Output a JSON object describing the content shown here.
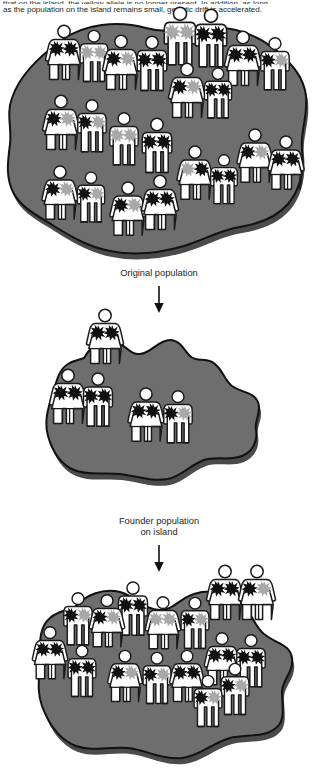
{
  "caption": {
    "line1": "that on the island, the yellow allele is no longer present. In addition, as long",
    "line2": "as the population on the island remains small, genetic drift is accelerated."
  },
  "labels": {
    "original": "Original population",
    "founder_line1": "Founder population",
    "founder_line2": "on island"
  },
  "legend_semantics": {
    "island_fill": "#6e6e6e",
    "island_shadow": "#2b2b2b",
    "island_outline": "#111111",
    "figure_fill": "#ffffff",
    "figure_outline": "#1a1a1a",
    "allele_dark": "#111111",
    "allele_light": "#a8a8a8",
    "background": "#ffffff",
    "text": "#231f20",
    "arrow": "#111111"
  },
  "panels": [
    {
      "id": "original-population",
      "name": "Original population",
      "island_shape": "large irregular blob spanning full width",
      "population_count": 24,
      "people": [
        {
          "id": 1,
          "sex": "female",
          "x": 64,
          "y": 42,
          "s": 1.0,
          "alleles": [
            "dark",
            "dark"
          ]
        },
        {
          "id": 2,
          "sex": "male",
          "x": 94,
          "y": 45,
          "s": 0.94,
          "alleles": [
            "light",
            "light"
          ]
        },
        {
          "id": 3,
          "sex": "female",
          "x": 121,
          "y": 52,
          "s": 1.0,
          "alleles": [
            "dark",
            "light"
          ]
        },
        {
          "id": 4,
          "sex": "male",
          "x": 152,
          "y": 53,
          "s": 1.0,
          "alleles": [
            "dark",
            "dark"
          ]
        },
        {
          "id": 5,
          "sex": "male",
          "x": 180,
          "y": 26,
          "s": 1.06,
          "alleles": [
            "light",
            "light"
          ]
        },
        {
          "id": 6,
          "sex": "male",
          "x": 211,
          "y": 28,
          "s": 1.06,
          "alleles": [
            "dark",
            "dark"
          ]
        },
        {
          "id": 7,
          "sex": "female",
          "x": 243,
          "y": 48,
          "s": 1.0,
          "alleles": [
            "dark",
            "dark"
          ]
        },
        {
          "id": 8,
          "sex": "male",
          "x": 275,
          "y": 53,
          "s": 0.96,
          "alleles": [
            "dark",
            "light"
          ]
        },
        {
          "id": 9,
          "sex": "female",
          "x": 187,
          "y": 80,
          "s": 1.0,
          "alleles": [
            "dark",
            "light"
          ]
        },
        {
          "id": 10,
          "sex": "male",
          "x": 218,
          "y": 82,
          "s": 0.92,
          "alleles": [
            "dark",
            "dark"
          ]
        },
        {
          "id": 11,
          "sex": "female",
          "x": 61,
          "y": 112,
          "s": 1.0,
          "alleles": [
            "dark",
            "light"
          ]
        },
        {
          "id": 12,
          "sex": "male",
          "x": 92,
          "y": 115,
          "s": 0.96,
          "alleles": [
            "dark",
            "light"
          ]
        },
        {
          "id": 13,
          "sex": "male",
          "x": 124,
          "y": 128,
          "s": 0.96,
          "alleles": [
            "light",
            "light"
          ]
        },
        {
          "id": 14,
          "sex": "male",
          "x": 157,
          "y": 135,
          "s": 1.0,
          "alleles": [
            "dark",
            "dark"
          ]
        },
        {
          "id": 15,
          "sex": "female",
          "x": 255,
          "y": 145,
          "s": 0.98,
          "alleles": [
            "dark",
            "light"
          ]
        },
        {
          "id": 16,
          "sex": "female",
          "x": 286,
          "y": 152,
          "s": 0.98,
          "alleles": [
            "dark",
            "dark"
          ]
        },
        {
          "id": 17,
          "sex": "female",
          "x": 195,
          "y": 162,
          "s": 0.98,
          "alleles": [
            "light",
            "dark"
          ]
        },
        {
          "id": 18,
          "sex": "male",
          "x": 224,
          "y": 168,
          "s": 0.9,
          "alleles": [
            "dark",
            "dark"
          ]
        },
        {
          "id": 19,
          "sex": "female",
          "x": 60,
          "y": 182,
          "s": 0.98,
          "alleles": [
            "dark",
            "light"
          ]
        },
        {
          "id": 20,
          "sex": "male",
          "x": 91,
          "y": 186,
          "s": 0.92,
          "alleles": [
            "dark",
            "light"
          ]
        },
        {
          "id": 21,
          "sex": "female",
          "x": 128,
          "y": 198,
          "s": 0.98,
          "alleles": [
            "dark",
            "light"
          ]
        },
        {
          "id": 22,
          "sex": "female",
          "x": 160,
          "y": 192,
          "s": 1.0,
          "alleles": [
            "dark",
            "dark"
          ]
        }
      ]
    },
    {
      "id": "founder-population",
      "name": "Founder population on island",
      "island_shape": "smaller lobed blob, centre of frame",
      "population_count": 5,
      "people": [
        {
          "id": 1,
          "sex": "female",
          "x": 105,
          "y": 22,
          "s": 1.0,
          "alleles": [
            "dark",
            "dark"
          ]
        },
        {
          "id": 2,
          "sex": "female",
          "x": 68,
          "y": 82,
          "s": 1.0,
          "alleles": [
            "dark",
            "dark"
          ]
        },
        {
          "id": 3,
          "sex": "male",
          "x": 98,
          "y": 85,
          "s": 0.98,
          "alleles": [
            "dark",
            "dark"
          ]
        },
        {
          "id": 4,
          "sex": "female",
          "x": 146,
          "y": 100,
          "s": 0.98,
          "alleles": [
            "dark",
            "dark"
          ]
        },
        {
          "id": 5,
          "sex": "male",
          "x": 178,
          "y": 102,
          "s": 0.96,
          "alleles": [
            "dark",
            "light"
          ]
        }
      ]
    },
    {
      "id": "expanded-island-population",
      "name": "Expanded island population",
      "island_shape": "wide lobed blob spanning most of frame",
      "population_count": 20,
      "people": [
        {
          "id": 1,
          "sex": "female",
          "x": 225,
          "y": 22,
          "s": 1.0,
          "alleles": [
            "dark",
            "dark"
          ]
        },
        {
          "id": 2,
          "sex": "female",
          "x": 257,
          "y": 22,
          "s": 1.0,
          "alleles": [
            "dark",
            "light"
          ]
        },
        {
          "id": 3,
          "sex": "male",
          "x": 133,
          "y": 38,
          "s": 0.98,
          "alleles": [
            "dark",
            "dark"
          ]
        },
        {
          "id": 4,
          "sex": "male",
          "x": 78,
          "y": 48,
          "s": 0.96,
          "alleles": [
            "dark",
            "light"
          ]
        },
        {
          "id": 5,
          "sex": "female",
          "x": 107,
          "y": 50,
          "s": 0.96,
          "alleles": [
            "dark",
            "light"
          ]
        },
        {
          "id": 6,
          "sex": "female",
          "x": 163,
          "y": 52,
          "s": 0.96,
          "alleles": [
            "light",
            "light"
          ]
        },
        {
          "id": 7,
          "sex": "male",
          "x": 195,
          "y": 52,
          "s": 0.94,
          "alleles": [
            "dark",
            "light"
          ]
        },
        {
          "id": 8,
          "sex": "female",
          "x": 50,
          "y": 82,
          "s": 0.96,
          "alleles": [
            "dark",
            "dark"
          ]
        },
        {
          "id": 9,
          "sex": "female",
          "x": 222,
          "y": 88,
          "s": 0.96,
          "alleles": [
            "dark",
            "dark"
          ]
        },
        {
          "id": 10,
          "sex": "male",
          "x": 251,
          "y": 90,
          "s": 0.96,
          "alleles": [
            "dark",
            "dark"
          ]
        },
        {
          "id": 11,
          "sex": "male",
          "x": 82,
          "y": 100,
          "s": 0.94,
          "alleles": [
            "dark",
            "dark"
          ]
        },
        {
          "id": 12,
          "sex": "female",
          "x": 125,
          "y": 105,
          "s": 0.94,
          "alleles": [
            "dark",
            "light"
          ]
        },
        {
          "id": 13,
          "sex": "male",
          "x": 157,
          "y": 107,
          "s": 0.94,
          "alleles": [
            "dark",
            "light"
          ]
        },
        {
          "id": 14,
          "sex": "female",
          "x": 187,
          "y": 105,
          "s": 0.94,
          "alleles": [
            "dark",
            "dark"
          ]
        },
        {
          "id": 15,
          "sex": "male",
          "x": 235,
          "y": 118,
          "s": 0.94,
          "alleles": [
            "dark",
            "light"
          ]
        },
        {
          "id": 16,
          "sex": "male",
          "x": 208,
          "y": 130,
          "s": 0.94,
          "alleles": [
            "dark",
            "light"
          ]
        }
      ]
    }
  ]
}
